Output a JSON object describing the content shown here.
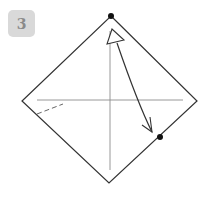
{
  "step": {
    "number": "3"
  },
  "diagram": {
    "colors": {
      "outline": "#333333",
      "crease": "#888888",
      "dot": "#111111",
      "badge_bg": "#d9d9d9",
      "badge_text": "#8a8a8a"
    },
    "square_corners": {
      "top": [
        111,
        16
      ],
      "right": [
        197,
        101
      ],
      "bottom": [
        109,
        183
      ],
      "left": [
        22,
        101
      ]
    },
    "points": [
      {
        "name": "top-point",
        "x": 111,
        "y": 16
      },
      {
        "name": "target-point",
        "x": 160,
        "y": 137
      }
    ],
    "creases": [
      {
        "name": "vertical-crease",
        "from": [
          110,
          31
        ],
        "to": [
          110,
          170
        ]
      },
      {
        "name": "horizontal-crease",
        "from": [
          37,
          100
        ],
        "to": [
          183,
          100
        ]
      }
    ],
    "dashed_lines": [
      {
        "name": "valley-fold-line",
        "from": [
          37,
          114
        ],
        "to": [
          63,
          104
        ]
      }
    ],
    "arrows": [
      {
        "name": "fold-arrow",
        "direction": "top point to lower-right edge",
        "style": "hollow head at top, open head at bottom"
      }
    ]
  },
  "caption": {
    "text": ""
  }
}
